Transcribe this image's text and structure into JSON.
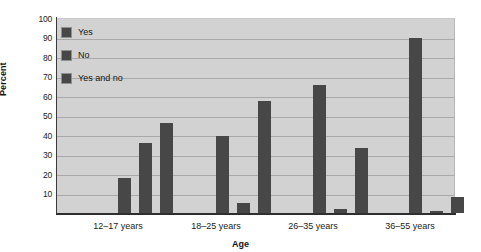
{
  "chart_data": {
    "type": "bar",
    "title": "",
    "xlabel": "Age",
    "ylabel": "Percent",
    "categories": [
      "12–17 years",
      "18–25 years",
      "26–35 years",
      "36–55 years"
    ],
    "series": [
      {
        "name": "Yes",
        "values": [
          18,
          39.5,
          65.5,
          90
        ]
      },
      {
        "name": "No",
        "values": [
          36,
          5,
          2,
          1
        ]
      },
      {
        "name": "Yes and no",
        "values": [
          46,
          57.5,
          33.5,
          8
        ]
      }
    ],
    "ylim": [
      0,
      100
    ],
    "yticks": [
      10,
      20,
      30,
      40,
      50,
      60,
      70,
      80,
      90,
      100
    ],
    "grid": true,
    "legend_position": "top-left-inside",
    "colors": {
      "bar": "#474747",
      "plot_background": "#d2d2d2",
      "gridline": "#a9a9a9",
      "axis": "#2f2f2f",
      "text": "#1b1b1b",
      "page_background": "#ffffff"
    }
  }
}
